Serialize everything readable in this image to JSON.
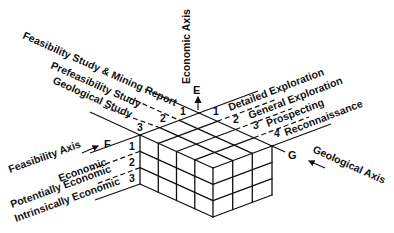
{
  "diagram": {
    "type": "UNFC three-dimensional classification cube",
    "colors": {
      "line": "#111111",
      "background": "#ffffff"
    },
    "axes": {
      "economic": {
        "title": "Economic Axis",
        "letter": "E"
      },
      "feasibility": {
        "title": "Feasibility Axis",
        "letter": "F"
      },
      "geological": {
        "title": "Geological Axis",
        "letter": "G"
      }
    },
    "feasibility_levels": [
      {
        "num": "1",
        "label": "Feasibility Study & Mining Report"
      },
      {
        "num": "2",
        "label": "Prefeasibility Study"
      },
      {
        "num": "3",
        "label": "Geological Study"
      }
    ],
    "geological_levels": [
      {
        "num": "1",
        "label": "Detailed Exploration"
      },
      {
        "num": "2",
        "label": "General Exploration"
      },
      {
        "num": "3",
        "label": "Prospecting"
      },
      {
        "num": "4",
        "label": "Reconnaissance"
      }
    ],
    "economic_levels": [
      {
        "num": "1",
        "label": "Economic"
      },
      {
        "num": "2",
        "label": "Potentially Economic"
      },
      {
        "num": "3",
        "label": "Intrinsically Economic"
      }
    ],
    "cube": {
      "geological_divisions": 4,
      "feasibility_divisions": 3,
      "economic_divisions": 3
    }
  }
}
